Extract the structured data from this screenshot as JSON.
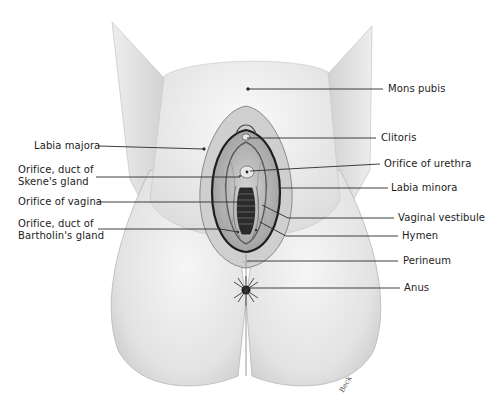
{
  "figure": {
    "artist_signature": "Beck"
  },
  "labels_left": [
    {
      "id": "labia-majora",
      "text": [
        "Labia majora"
      ]
    },
    {
      "id": "orifice-duct-skenes-gland",
      "text": [
        "Orifice, duct of",
        "Skene's gland"
      ]
    },
    {
      "id": "orifice-vagina",
      "text": [
        "Orifice of vagina"
      ]
    },
    {
      "id": "orifice-duct-bartholins-gland",
      "text": [
        "Orifice, duct of",
        "Bartholin's gland"
      ]
    }
  ],
  "labels_right": [
    {
      "id": "mons-pubis",
      "text": [
        "Mons pubis"
      ]
    },
    {
      "id": "clitoris",
      "text": [
        "Clitoris"
      ]
    },
    {
      "id": "orifice-urethra",
      "text": [
        "Orifice of urethra"
      ]
    },
    {
      "id": "labia-minora",
      "text": [
        "Labia minora"
      ]
    },
    {
      "id": "vaginal-vestibule",
      "text": [
        "Vaginal vestibule"
      ]
    },
    {
      "id": "hymen",
      "text": [
        "Hymen"
      ]
    },
    {
      "id": "perineum",
      "text": [
        "Perineum"
      ]
    },
    {
      "id": "anus",
      "text": [
        "Anus"
      ]
    }
  ],
  "colors": {
    "leader_line": "#2a2a2a",
    "skin_light": "#f2f2f2",
    "skin_mid": "#d9d9d9",
    "skin_shadow": "#b5b5b5",
    "dark_detail": "#2e2e2e"
  }
}
